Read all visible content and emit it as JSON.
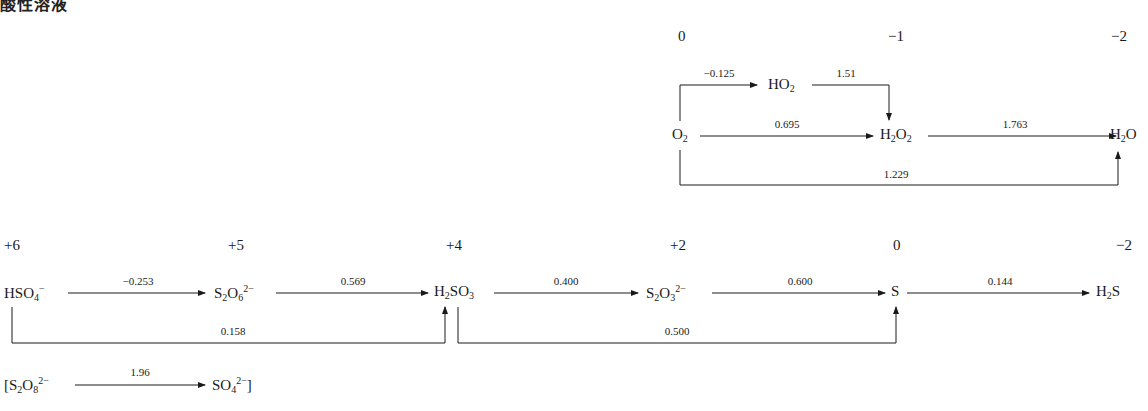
{
  "title": "酸性溶液",
  "oxygen": {
    "oxidation_states": [
      "0",
      "−1",
      "−2"
    ],
    "species": {
      "o2": "O2",
      "ho2": "HO2",
      "h2o2": "H2O2",
      "h2o": "H2O"
    },
    "potentials": {
      "o2_ho2": "−0.125",
      "ho2_h2o2": "1.51",
      "o2_h2o2": "0.695",
      "h2o2_h2o": "1.763",
      "o2_h2o": "1.229"
    }
  },
  "sulfur": {
    "oxidation_states": [
      "+6",
      "+5",
      "+4",
      "+2",
      "0",
      "−2"
    ],
    "potentials": {
      "hso4_s2o6": "−0.253",
      "s2o6_h2so3": "0.569",
      "h2so3_s2o3": "0.400",
      "s2o3_s": "0.600",
      "s_h2s": "0.144",
      "hso4_h2so3": "0.158",
      "h2so3_s": "0.500"
    },
    "peroxo": {
      "potential": "1.96"
    }
  }
}
